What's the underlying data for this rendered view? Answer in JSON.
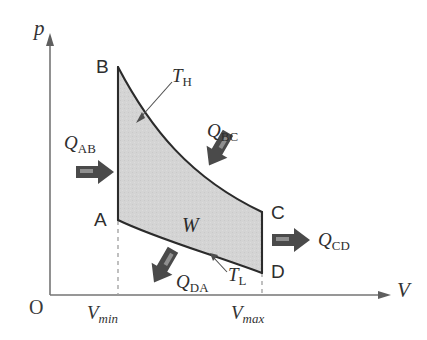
{
  "figure": {
    "kind": "pressure-volume-diagram"
  },
  "axes": {
    "y_label": "p",
    "x_label": "V",
    "origin_label": "O",
    "x_ticks": [
      {
        "id": "vmin",
        "symbol": "V",
        "subscript": "min"
      },
      {
        "id": "vmax",
        "symbol": "V",
        "subscript": "max"
      }
    ]
  },
  "vertices": [
    {
      "id": "A",
      "label": "A"
    },
    {
      "id": "B",
      "label": "B"
    },
    {
      "id": "C",
      "label": "C"
    },
    {
      "id": "D",
      "label": "D"
    }
  ],
  "isotherms": [
    {
      "id": "hot",
      "symbol": "T",
      "subscript": "H"
    },
    {
      "id": "cold",
      "symbol": "T",
      "subscript": "L"
    }
  ],
  "work_region": {
    "symbol": "W",
    "fill_color": "#d2d2d2"
  },
  "heat_flows": [
    {
      "id": "QAB",
      "symbol": "Q",
      "subscript": "AB",
      "direction": "right"
    },
    {
      "id": "QBC",
      "symbol": "Q",
      "subscript": "BC",
      "direction": "down-left"
    },
    {
      "id": "QCD",
      "symbol": "Q",
      "subscript": "CD",
      "direction": "right"
    },
    {
      "id": "QDA",
      "symbol": "Q",
      "subscript": "DA",
      "direction": "down-left"
    }
  ],
  "colors": {
    "curve": "#2b2b2b",
    "axis": "#6f6f6f",
    "arrow": "#4a4a4a",
    "arrow_highlight": "#8d8d8d",
    "shade": "#d2d2d2",
    "dashed": "#9a9a9a",
    "text": "#2a2a2a"
  }
}
